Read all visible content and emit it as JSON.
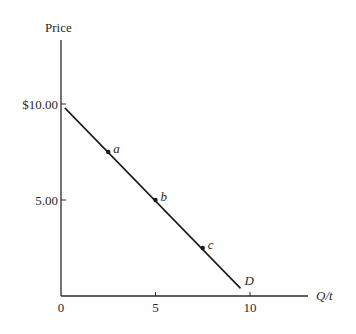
{
  "chart_data": {
    "type": "line",
    "title": "",
    "xlabel": "Q/t",
    "ylabel": "Price",
    "xlim": [
      0,
      13
    ],
    "ylim": [
      0,
      13
    ],
    "grid": false,
    "legend": null,
    "x_ticks": [
      {
        "value": 0,
        "label": "0"
      },
      {
        "value": 5,
        "label": "5"
      },
      {
        "value": 10,
        "label": "10"
      }
    ],
    "y_ticks": [
      {
        "value": 10,
        "label": "$10.00"
      },
      {
        "value": 5,
        "label": "5.00"
      }
    ],
    "series": [
      {
        "name": "D",
        "label": "D",
        "x": [
          0.2,
          9.5
        ],
        "y": [
          9.8,
          0.4
        ]
      }
    ],
    "points": [
      {
        "label": "a",
        "x": 2.5,
        "y": 7.5
      },
      {
        "label": "b",
        "x": 5,
        "y": 5
      },
      {
        "label": "c",
        "x": 7.5,
        "y": 2.5
      }
    ]
  },
  "colors": {
    "ink": "#2a2a2a",
    "background": "#ffffff"
  }
}
